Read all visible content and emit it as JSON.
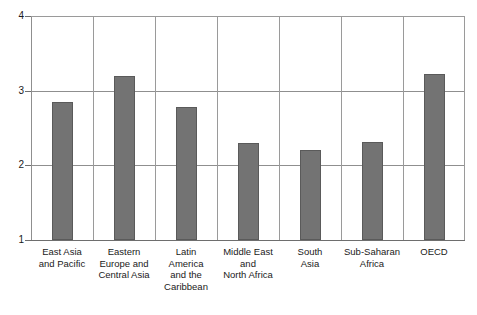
{
  "chart_data": {
    "type": "bar",
    "title": "",
    "xlabel": "",
    "ylabel": "",
    "ylim": [
      1,
      4
    ],
    "yticks": [
      "1",
      "2",
      "3",
      "4"
    ],
    "grid": true,
    "legend": null,
    "categories": [
      "East Asia\nand Pacific",
      "Eastern\nEurope and\nCentral Asia",
      "Latin\nAmerica\nand the\nCaribbean",
      "Middle East\nand\nNorth Africa",
      "South\nAsia",
      "Sub-Saharan\nAfrica",
      "OECD"
    ],
    "values": [
      2.85,
      3.2,
      2.78,
      2.3,
      2.2,
      2.31,
      3.22
    ],
    "bar_color": "#737373",
    "bar_border_color": "#5a5a5a",
    "grid_color": "#8f8f8f",
    "axis_color": "#6e6e6e",
    "background": "#ffffff"
  },
  "clipped_header": {
    "text": ""
  }
}
